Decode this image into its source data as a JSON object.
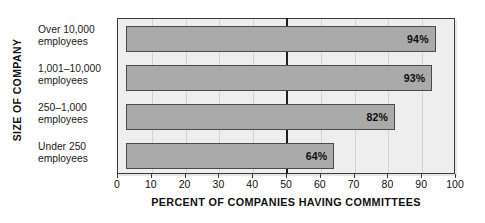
{
  "chart_data": {
    "type": "bar",
    "orientation": "horizontal",
    "title": "",
    "xlabel": "PERCENT OF COMPANIES HAVING COMMITTEES",
    "ylabel": "SIZE OF COMPANY",
    "categories": [
      "Over 10,000 employees",
      "1,001–10,000 employees",
      "250–1,000 employees",
      "Under 250 employees"
    ],
    "category_lines": [
      [
        "Over 10,000",
        "employees"
      ],
      [
        "1,001–10,000",
        "employees"
      ],
      [
        "250–1,000",
        "employees"
      ],
      [
        "Under 250",
        "employees"
      ]
    ],
    "values": [
      94,
      93,
      82,
      64
    ],
    "value_labels": [
      "94%",
      "93%",
      "82%",
      "64%"
    ],
    "bar_start": 2.5,
    "xlim": [
      0,
      100
    ],
    "xticks": [
      0,
      10,
      20,
      30,
      40,
      50,
      60,
      70,
      80,
      90,
      100
    ],
    "xtick_labels": [
      "0",
      "10",
      "20",
      "30",
      "40",
      "50",
      "60",
      "70",
      "80",
      "90",
      "100"
    ],
    "grid": true,
    "legend": null,
    "reference_line": 50,
    "colors": {
      "bar_fill": "#aaaaaa",
      "bar_border": "#4a4a4a",
      "plot_background": "#eeeeee",
      "frame": "#3a3a3a",
      "gridline": "#d2d2d2",
      "reference_line": "#1e1e1e",
      "text": "#111111"
    }
  }
}
